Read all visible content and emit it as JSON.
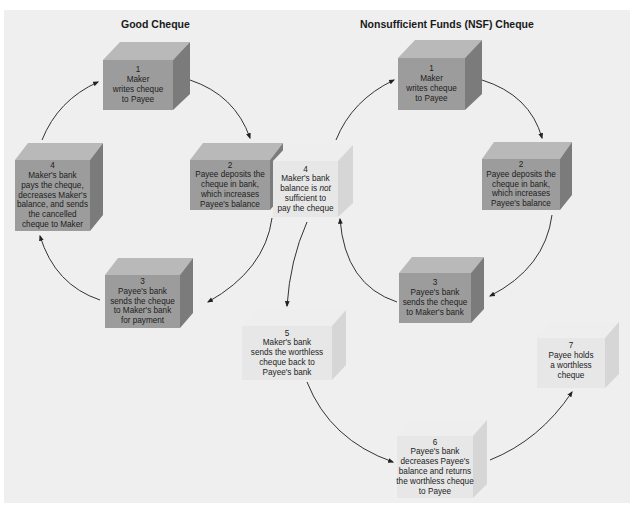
{
  "panel": {
    "background": "#efefef"
  },
  "titles": {
    "good": "Good Cheque",
    "nsf": "Nonsufficient Funds (NSF) Cheque"
  },
  "colors": {
    "dark_front": "#9c9c9c",
    "dark_top": "#b9b9b9",
    "dark_side": "#7b7b7b",
    "light_front": "#e7e7e7",
    "light_top": "#eeeeee",
    "light_side": "#d6d6d6",
    "arrow": "#333333"
  },
  "good_cheque": {
    "steps": [
      {
        "number": "1",
        "lines": [
          "Maker",
          "writes cheque",
          "to Payee"
        ]
      },
      {
        "number": "2",
        "lines": [
          "Payee deposits the",
          "cheque in bank,",
          "which increases",
          "Payee's balance"
        ]
      },
      {
        "number": "3",
        "lines": [
          "Payee's bank",
          "sends the cheque",
          "to Maker's bank",
          "for payment"
        ]
      },
      {
        "number": "4",
        "lines": [
          "Maker's bank",
          "pays the cheque,",
          "decreases Maker's",
          "balance, and sends",
          "the cancelled",
          "cheque to Maker"
        ]
      }
    ]
  },
  "nsf_cheque": {
    "steps": [
      {
        "number": "1",
        "lines": [
          "Maker",
          "writes cheque",
          "to Payee"
        ]
      },
      {
        "number": "2",
        "lines": [
          "Payee deposits the",
          "cheque in bank,",
          "which increases",
          "Payee's balance"
        ]
      },
      {
        "number": "3",
        "lines": [
          "Payee's bank",
          "sends the cheque",
          "to Maker's bank"
        ]
      },
      {
        "number": "4",
        "lines": [
          "Maker's bank",
          "balance is not",
          "sufficient to",
          "pay the cheque"
        ],
        "emphasis": "not"
      },
      {
        "number": "5",
        "lines": [
          "Maker's bank",
          "sends the worthless",
          "cheque back to",
          "Payee's bank"
        ]
      },
      {
        "number": "6",
        "lines": [
          "Payee's bank",
          "decreases Payee's",
          "balance and returns",
          "the worthless cheque",
          "to Payee"
        ]
      },
      {
        "number": "7",
        "lines": [
          "Payee holds",
          "a worthless",
          "cheque"
        ]
      }
    ]
  }
}
